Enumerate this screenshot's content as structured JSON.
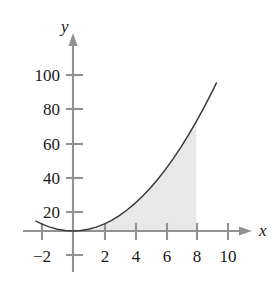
{
  "chart_data": {
    "type": "line",
    "title": "",
    "subtitle": "",
    "xlabel": "x",
    "ylabel": "y",
    "function": "y = x^2",
    "xlim": [
      -3.0,
      11.2
    ],
    "ylim": [
      -14,
      118
    ],
    "grid": false,
    "legend": null,
    "x_ticks": [
      -2,
      2,
      4,
      6,
      8,
      10
    ],
    "x_tick_labels": [
      "−2",
      "2",
      "4",
      "6",
      "8",
      "10"
    ],
    "y_ticks": [
      20,
      40,
      60,
      80,
      100
    ],
    "y_tick_labels": [
      "20",
      "40",
      "60",
      "80",
      "100"
    ],
    "x": [
      -2.4,
      -2.0,
      -1.5,
      -1.0,
      -0.5,
      0,
      0.5,
      1,
      1.5,
      2,
      2.5,
      3,
      3.5,
      4,
      4.5,
      5,
      5.5,
      6,
      6.5,
      7,
      7.5,
      8,
      8.5,
      9,
      9.3
    ],
    "y": [
      5.76,
      4.0,
      2.25,
      1.0,
      0.25,
      0,
      0.25,
      1,
      2.25,
      4,
      6.25,
      9,
      12.25,
      16,
      20.25,
      25,
      30.25,
      36,
      42.25,
      49,
      56.25,
      64,
      72.25,
      81,
      86.49
    ],
    "series": [
      {
        "name": "y = x^2",
        "values": [
          5.76,
          4.0,
          2.25,
          1.0,
          0.25,
          0,
          0.25,
          1,
          2.25,
          4,
          6.25,
          9,
          12.25,
          16,
          20.25,
          25,
          30.25,
          36,
          42.25,
          49,
          56.25,
          64,
          72.25,
          81,
          86.49
        ],
        "color": "#3a3a3a"
      }
    ],
    "shaded_region": {
      "label": "area under curve",
      "x_from": 0,
      "x_to": 8,
      "bounded_above_by": "y = x^2",
      "bounded_below_by": "y = 0",
      "area_value": 170.67,
      "fill_color": "#e8e8e8"
    },
    "annotations": [],
    "axis_color": "#8f8f8f",
    "curve_color": "#3a3a3a"
  },
  "axes": {
    "y_axis_label": "y",
    "x_axis_label": "x"
  },
  "y_axis_ticks": [
    {
      "label": "100",
      "value": 100
    },
    {
      "label": "80",
      "value": 80
    },
    {
      "label": "60",
      "value": 60
    },
    {
      "label": "40",
      "value": 40
    },
    {
      "label": "20",
      "value": 20
    }
  ],
  "x_axis_ticks": [
    {
      "label": "−2",
      "value": -2
    },
    {
      "label": "2",
      "value": 2
    },
    {
      "label": "4",
      "value": 4
    },
    {
      "label": "6",
      "value": 6
    },
    {
      "label": "8",
      "value": 8
    },
    {
      "label": "10",
      "value": 10
    }
  ]
}
